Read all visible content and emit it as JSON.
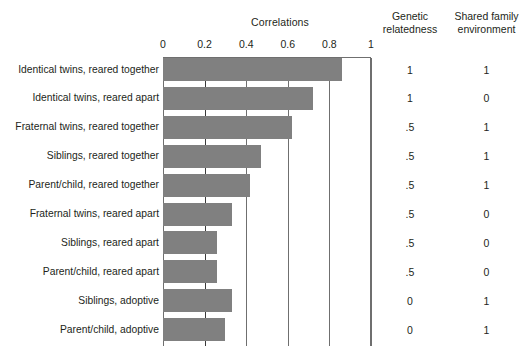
{
  "header": {
    "correlations_title": "Correlations",
    "genetic_col_line1": "Genetic",
    "genetic_col_line2": "relatedness",
    "shared_col_line1": "Shared family",
    "shared_col_line2": "environment"
  },
  "axis": {
    "ticks": [
      "0",
      "0.2",
      "0.4",
      "0.6",
      "0.8",
      "1"
    ]
  },
  "rows": [
    {
      "label": "Identical twins, reared together",
      "correlation": 0.86,
      "genetic": "1",
      "shared": "1"
    },
    {
      "label": "Identical twins, reared apart",
      "correlation": 0.72,
      "genetic": "1",
      "shared": "0"
    },
    {
      "label": "Fraternal twins, reared together",
      "correlation": 0.62,
      "genetic": ".5",
      "shared": "1"
    },
    {
      "label": "Siblings, reared together",
      "correlation": 0.47,
      "genetic": ".5",
      "shared": "1"
    },
    {
      "label": "Parent/child, reared together",
      "correlation": 0.42,
      "genetic": ".5",
      "shared": "1"
    },
    {
      "label": "Fraternal twins, reared apart",
      "correlation": 0.33,
      "genetic": ".5",
      "shared": "0"
    },
    {
      "label": "Siblings, reared apart",
      "correlation": 0.26,
      "genetic": ".5",
      "shared": "0"
    },
    {
      "label": "Parent/child, reared apart",
      "correlation": 0.26,
      "genetic": ".5",
      "shared": "0"
    },
    {
      "label": "Siblings, adoptive",
      "correlation": 0.33,
      "genetic": "0",
      "shared": "1"
    },
    {
      "label": "Parent/child, adoptive",
      "correlation": 0.3,
      "genetic": "0",
      "shared": "1"
    }
  ],
  "colors": {
    "bar": "#808080",
    "gridline": "#6f6f6f",
    "gridline_major": "#3a3a3a",
    "text": "#231f20",
    "background": "#ffffff"
  },
  "chart_data": {
    "type": "bar",
    "orientation": "horizontal",
    "title": "Correlations",
    "xlabel": "",
    "ylabel": "",
    "xlim": [
      0,
      1
    ],
    "grid": true,
    "legend": "none",
    "categories": [
      "Identical twins, reared together",
      "Identical twins, reared apart",
      "Fraternal twins, reared together",
      "Siblings, reared together",
      "Parent/child, reared together",
      "Fraternal twins, reared apart",
      "Siblings, reared apart",
      "Parent/child, reared apart",
      "Siblings, adoptive",
      "Parent/child, adoptive"
    ],
    "values": [
      0.86,
      0.72,
      0.62,
      0.47,
      0.42,
      0.33,
      0.26,
      0.26,
      0.33,
      0.3
    ],
    "xticks": [
      0,
      0.2,
      0.4,
      0.6,
      0.8,
      1
    ],
    "xticklabels": [
      "0",
      "0.2",
      "0.4",
      "0.6",
      "0.8",
      "1"
    ],
    "annotation_columns": [
      {
        "name": "Genetic relatedness",
        "values": [
          "1",
          "1",
          ".5",
          ".5",
          ".5",
          ".5",
          ".5",
          ".5",
          "0",
          "0"
        ]
      },
      {
        "name": "Shared family environment",
        "values": [
          "1",
          "0",
          "1",
          "1",
          "1",
          "0",
          "0",
          "0",
          "1",
          "1"
        ]
      }
    ]
  }
}
